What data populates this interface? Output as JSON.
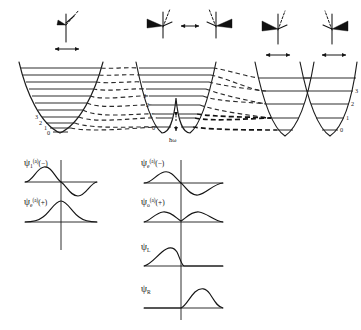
{
  "colors": {
    "ink": "#1a1a1a",
    "curve": "#1d1d1d",
    "level": "#232323",
    "dashed": "#2a2a2a",
    "background": "#ffffff"
  },
  "potentials": {
    "left_well": {
      "name": "single-well",
      "level_labels": [
        "0",
        "1",
        "2",
        "3"
      ],
      "level_count": 10
    },
    "middle_well": {
      "name": "double-well-small-barrier",
      "level_labels": [
        "0",
        "1",
        "2",
        "3"
      ],
      "level_count": 9,
      "splitting_label": "ħω"
    },
    "right_well": {
      "name": "double-well-large-barrier",
      "level_labels": [
        "0",
        "1",
        "2",
        "3"
      ],
      "level_count": 5
    }
  },
  "molecules": {
    "left": {
      "name": "planar-transition-state",
      "arrow": "double-headed"
    },
    "middle_a": {
      "name": "pyramidal-left"
    },
    "middle_b": {
      "name": "pyramidal-right"
    },
    "middle_arrow": "double-headed",
    "right_a": {
      "name": "pyramidal-left-localized",
      "arrow": "double-headed"
    },
    "right_b": {
      "name": "pyramidal-right-localized",
      "arrow": "double-headed"
    }
  },
  "wavefunctions": {
    "panel_left": [
      {
        "id": "psi-odd-a-minus",
        "symbol": "ψ",
        "sub": "1",
        "sup": "(a)",
        "paren": "(−)",
        "shape": "antisymmetric"
      },
      {
        "id": "psi-even-a-plus",
        "symbol": "ψ",
        "sub": "e",
        "sup": "(a)",
        "paren": "(+)",
        "shape": "symmetric-single-hump"
      }
    ],
    "panel_right": [
      {
        "id": "psi-even-a-minus",
        "symbol": "ψ",
        "sub": "e",
        "sup": "(a)",
        "paren": "(−)",
        "shape": "antisymmetric-two-lobe"
      },
      {
        "id": "psi-odd-a-plus",
        "symbol": "ψ",
        "sub": "o",
        "sup": "(a)",
        "paren": "(+)",
        "shape": "symmetric-two-hump"
      },
      {
        "id": "psi-left",
        "symbol": "ψ",
        "sub": "L",
        "sup": "",
        "paren": "",
        "shape": "localized-left"
      },
      {
        "id": "psi-right",
        "symbol": "ψ",
        "sub": "R",
        "sup": "",
        "paren": "",
        "shape": "localized-right"
      }
    ]
  }
}
